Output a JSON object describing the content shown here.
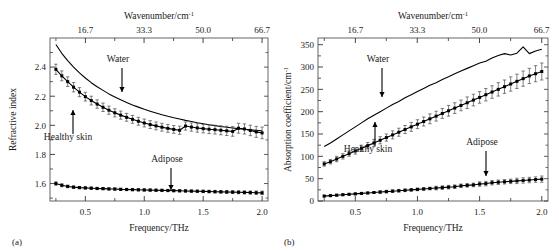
{
  "figure": {
    "panels": [
      {
        "id": "a",
        "label": "(a)",
        "top_axis_title": "Wavenumber/cm",
        "top_axis_title_sup": "-1",
        "top_ticks": [
          "16.7",
          "33.3",
          "50.0",
          "66.7"
        ],
        "top_tick_values": [
          16.7,
          33.3,
          50.0,
          66.7
        ],
        "x_label": "Frequency/THz",
        "x_ticks": [
          "0.5",
          "1.0",
          "1.5",
          "2.0"
        ],
        "x_tick_values": [
          0.5,
          1.0,
          1.5,
          2.0
        ],
        "y_label": "Refractive index",
        "y_ticks": [
          "1.6",
          "1.8",
          "2.0",
          "2.2",
          "2.4"
        ],
        "y_tick_values": [
          1.6,
          1.8,
          2.0,
          2.2,
          2.4
        ],
        "annotations": [
          {
            "text": "Water",
            "target_series": "Water"
          },
          {
            "text": "Healthy skin",
            "target_series": "Healthy skin"
          },
          {
            "text": "Adipose",
            "target_series": "Adipose"
          }
        ]
      },
      {
        "id": "b",
        "label": "(b)",
        "top_axis_title": "Wavenumber/cm",
        "top_axis_title_sup": "-1",
        "top_ticks": [
          "16.7",
          "33.3",
          "50.0",
          "66.7"
        ],
        "top_tick_values": [
          16.7,
          33.3,
          50.0,
          66.7
        ],
        "x_label": "Frequency/THz",
        "x_ticks": [
          "0.5",
          "1.0",
          "1.5",
          "2.0"
        ],
        "x_tick_values": [
          0.5,
          1.0,
          1.5,
          2.0
        ],
        "y_label": "Absorption coefficient/cm",
        "y_label_sup": "-1",
        "y_ticks": [
          "0",
          "50",
          "100",
          "150",
          "200",
          "250",
          "300",
          "350"
        ],
        "y_tick_values": [
          0,
          50,
          100,
          150,
          200,
          250,
          300,
          350
        ],
        "annotations": [
          {
            "text": "Water",
            "target_series": "Water"
          },
          {
            "text": "Healthy skin",
            "target_series": "Healthy skin"
          },
          {
            "text": "Adipose",
            "target_series": "Adipose"
          }
        ]
      }
    ]
  },
  "chart_data": [
    {
      "type": "line",
      "panel": "a",
      "title": "",
      "xlabel": "Frequency/THz",
      "ylabel": "Refractive index",
      "secondary_xlabel": "Wavenumber/cm^-1",
      "xlim": [
        0.2,
        2.05
      ],
      "ylim": [
        1.48,
        2.6
      ],
      "secondary_xlim": [
        6.67,
        68.4
      ],
      "grid": false,
      "legend": "none (inline arrow annotations)",
      "x": [
        0.25,
        0.3,
        0.35,
        0.4,
        0.45,
        0.5,
        0.55,
        0.6,
        0.65,
        0.7,
        0.75,
        0.8,
        0.85,
        0.9,
        0.95,
        1.0,
        1.05,
        1.1,
        1.15,
        1.2,
        1.25,
        1.3,
        1.35,
        1.4,
        1.45,
        1.5,
        1.55,
        1.6,
        1.65,
        1.7,
        1.75,
        1.8,
        1.85,
        1.9,
        1.95,
        2.0
      ],
      "series": [
        {
          "name": "Water",
          "marker": "none",
          "errorbars": false,
          "values": [
            2.555,
            2.495,
            2.445,
            2.4,
            2.36,
            2.325,
            2.293,
            2.265,
            2.24,
            2.216,
            2.195,
            2.175,
            2.157,
            2.14,
            2.125,
            2.11,
            2.097,
            2.085,
            2.073,
            2.062,
            2.052,
            2.043,
            2.034,
            2.026,
            2.018,
            2.011,
            2.004,
            1.998,
            1.992,
            1.987,
            1.982,
            1.977,
            1.973,
            1.969,
            1.966,
            1.963
          ]
        },
        {
          "name": "Healthy skin",
          "marker": "square",
          "errorbars": true,
          "values": [
            2.385,
            2.34,
            2.3,
            2.262,
            2.228,
            2.197,
            2.17,
            2.146,
            2.124,
            2.104,
            2.086,
            2.07,
            2.055,
            2.041,
            2.028,
            2.016,
            2.005,
            1.996,
            1.987,
            1.979,
            1.972,
            1.966,
            1.995,
            1.988,
            1.982,
            1.977,
            1.973,
            1.97,
            1.966,
            1.962,
            1.958,
            1.98,
            1.975,
            1.965,
            1.955,
            1.948
          ],
          "error": [
            0.035,
            0.034,
            0.033,
            0.032,
            0.031,
            0.03,
            0.03,
            0.029,
            0.029,
            0.028,
            0.028,
            0.028,
            0.027,
            0.027,
            0.027,
            0.027,
            0.027,
            0.027,
            0.027,
            0.027,
            0.027,
            0.028,
            0.028,
            0.028,
            0.029,
            0.029,
            0.03,
            0.03,
            0.031,
            0.032,
            0.033,
            0.034,
            0.035,
            0.036,
            0.038,
            0.04
          ]
        },
        {
          "name": "Adipose",
          "marker": "square",
          "errorbars": true,
          "values": [
            1.6,
            1.588,
            1.58,
            1.575,
            1.572,
            1.57,
            1.568,
            1.566,
            1.565,
            1.563,
            1.562,
            1.56,
            1.559,
            1.558,
            1.557,
            1.556,
            1.555,
            1.554,
            1.553,
            1.552,
            1.551,
            1.55,
            1.549,
            1.548,
            1.547,
            1.546,
            1.545,
            1.544,
            1.543,
            1.542,
            1.541,
            1.54,
            1.539,
            1.538,
            1.537,
            1.536
          ],
          "error": [
            0.012,
            0.01,
            0.009,
            0.009,
            0.008,
            0.008,
            0.008,
            0.008,
            0.008,
            0.008,
            0.008,
            0.008,
            0.008,
            0.008,
            0.008,
            0.008,
            0.008,
            0.008,
            0.008,
            0.008,
            0.008,
            0.008,
            0.008,
            0.008,
            0.008,
            0.009,
            0.009,
            0.009,
            0.009,
            0.01,
            0.01,
            0.01,
            0.011,
            0.011,
            0.012,
            0.012
          ]
        }
      ]
    },
    {
      "type": "line",
      "panel": "b",
      "title": "",
      "xlabel": "Frequency/THz",
      "ylabel": "Absorption coefficient/cm^-1",
      "secondary_xlabel": "Wavenumber/cm^-1",
      "xlim": [
        0.2,
        2.05
      ],
      "ylim": [
        0,
        365
      ],
      "secondary_xlim": [
        6.67,
        68.4
      ],
      "grid": false,
      "legend": "none (inline arrow annotations)",
      "x": [
        0.25,
        0.3,
        0.35,
        0.4,
        0.45,
        0.5,
        0.55,
        0.6,
        0.65,
        0.7,
        0.75,
        0.8,
        0.85,
        0.9,
        0.95,
        1.0,
        1.05,
        1.1,
        1.15,
        1.2,
        1.25,
        1.3,
        1.35,
        1.4,
        1.45,
        1.5,
        1.55,
        1.6,
        1.65,
        1.7,
        1.75,
        1.8,
        1.85,
        1.9,
        1.95,
        2.0
      ],
      "series": [
        {
          "name": "Water",
          "marker": "none",
          "errorbars": false,
          "values": [
            122,
            130,
            139,
            148,
            157,
            166,
            175,
            184,
            192,
            200,
            208,
            216,
            223,
            231,
            238,
            245,
            252,
            259,
            265,
            272,
            278,
            285,
            291,
            297,
            303,
            309,
            313,
            320,
            326,
            330,
            327,
            331,
            345,
            330,
            336,
            340
          ]
        },
        {
          "name": "Healthy skin",
          "marker": "square",
          "errorbars": true,
          "values": [
            83,
            88,
            94,
            100,
            106,
            112,
            118,
            124,
            130,
            136,
            142,
            148,
            154,
            160,
            166,
            172,
            178,
            184,
            190,
            196,
            202,
            208,
            214,
            220,
            226,
            232,
            238,
            244,
            250,
            256,
            262,
            268,
            274,
            280,
            285,
            290
          ],
          "error": [
            5,
            5,
            6,
            6,
            6,
            7,
            7,
            7,
            8,
            8,
            8,
            9,
            9,
            9,
            10,
            10,
            10,
            11,
            11,
            11,
            12,
            12,
            12,
            13,
            13,
            13,
            14,
            14,
            15,
            15,
            16,
            16,
            17,
            17,
            18,
            19
          ]
        },
        {
          "name": "Adipose",
          "marker": "square",
          "errorbars": true,
          "values": [
            11,
            12,
            13,
            14,
            15,
            16,
            17,
            18,
            19,
            20,
            21,
            22,
            23,
            24,
            25,
            26,
            27,
            28,
            29,
            30,
            31,
            32,
            34,
            35,
            36,
            38,
            39,
            41,
            42,
            43,
            44,
            45,
            46,
            47,
            48,
            49
          ],
          "error": [
            2,
            2,
            2,
            2,
            2,
            2,
            2,
            2,
            2,
            3,
            3,
            3,
            3,
            3,
            3,
            3,
            3,
            3,
            4,
            4,
            4,
            4,
            4,
            4,
            4,
            5,
            5,
            5,
            5,
            5,
            5,
            6,
            6,
            6,
            6,
            7
          ]
        }
      ]
    }
  ]
}
